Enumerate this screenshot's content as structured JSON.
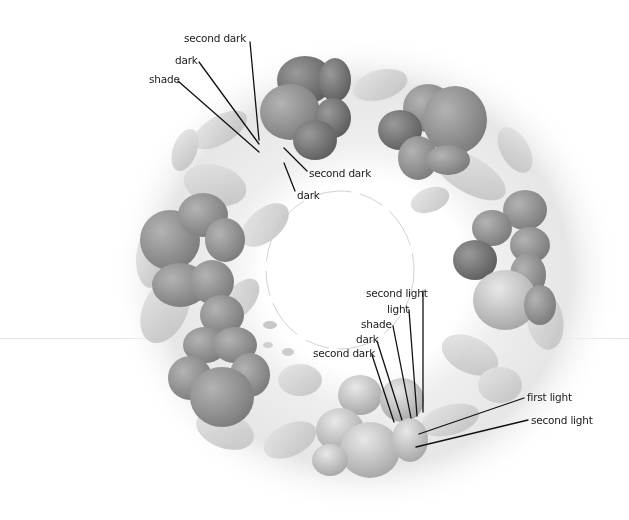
{
  "figure": {
    "colors": {
      "background": "#ffffff",
      "wash": "#ececec",
      "leaf_light": "#d9d9d9",
      "leaf_mid": "#bdbdbd",
      "petal_dark": "#6e6e6e",
      "petal_mid": "#8c8c8c",
      "petal_light": "#a8a8a8",
      "line": "#111111",
      "text": "#1a1a1a"
    }
  },
  "annotations": {
    "top_group": [
      {
        "text": "second dark",
        "x": 184,
        "y": 32,
        "line": [
          250,
          42,
          259,
          140
        ]
      },
      {
        "text": "dark",
        "x": 175,
        "y": 54,
        "line": [
          199,
          62,
          259,
          144
        ]
      },
      {
        "text": "shade",
        "x": 149,
        "y": 73,
        "line": [
          178,
          81,
          259,
          152
        ]
      },
      {
        "text": "second dark",
        "x": 309,
        "y": 167,
        "line": [
          284,
          148,
          307,
          171
        ]
      },
      {
        "text": "dark",
        "x": 297,
        "y": 189,
        "line": [
          284,
          163,
          295,
          191
        ]
      }
    ],
    "bottom_group": [
      {
        "text": "second light",
        "x": 366,
        "y": 287,
        "line": [
          423,
          291,
          423,
          412
        ]
      },
      {
        "text": "light",
        "x": 387,
        "y": 303,
        "line": [
          409,
          310,
          417,
          416
        ]
      },
      {
        "text": "shade",
        "x": 361,
        "y": 318,
        "line": [
          393,
          326,
          411,
          418
        ]
      },
      {
        "text": "dark",
        "x": 356,
        "y": 333,
        "line": [
          377,
          341,
          402,
          420
        ]
      },
      {
        "text": "second dark",
        "x": 313,
        "y": 347,
        "line": [
          372,
          355,
          394,
          422
        ]
      },
      {
        "text": "first light",
        "x": 527,
        "y": 391,
        "line": [
          524,
          398,
          419,
          434
        ]
      },
      {
        "text": "second light",
        "x": 531,
        "y": 414,
        "line": [
          528,
          420,
          416,
          447
        ]
      }
    ]
  }
}
